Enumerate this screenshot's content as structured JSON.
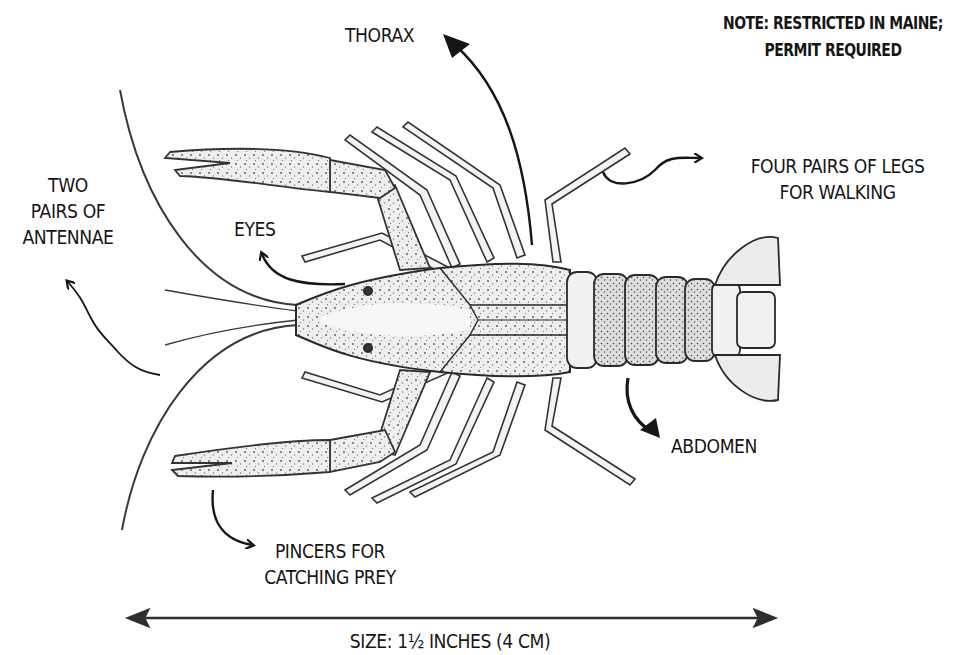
{
  "diagram": {
    "labels": {
      "thorax": "THORAX",
      "note_line1": "NOTE: RESTRICTED IN MAINE;",
      "note_line2": "PERMIT REQUIRED",
      "antennae_line1": "TWO",
      "antennae_line2": "PAIRS OF",
      "antennae_line3": "ANTENNAE",
      "eyes": "EYES",
      "legs_line1": "FOUR PAIRS OF LEGS",
      "legs_line2": "FOR WALKING",
      "abdomen": "ABDOMEN",
      "pincers_line1": "PINCERS FOR",
      "pincers_line2": "CATCHING PREY",
      "size": "SIZE: 1½ INCHES (4 CM)"
    },
    "colors": {
      "ink": "#161616",
      "shell_fill": "#f1f1ef",
      "shade": "#bdbdbd"
    }
  }
}
